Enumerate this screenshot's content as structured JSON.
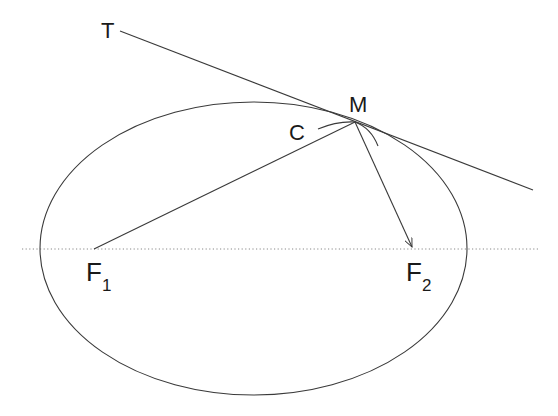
{
  "diagram": {
    "labels": {
      "tangent": "T",
      "point": "M",
      "curvature_circle": "C",
      "focus1_letter": "F",
      "focus1_sub": "1",
      "focus2_letter": "F",
      "focus2_sub": "2"
    },
    "colors": {
      "stroke": "#3a3a3a",
      "axis": "#888888",
      "text": "#1a1a1a"
    },
    "ellipse": {
      "cx": 253.5,
      "cy": 248.5,
      "rx": 213.5,
      "ry": 146.5
    },
    "points": {
      "M": [
        355,
        122
      ],
      "F1": [
        94,
        249
      ],
      "F2": [
        413,
        249
      ],
      "T_start": [
        120,
        31
      ],
      "T_end": [
        533,
        190
      ]
    }
  }
}
